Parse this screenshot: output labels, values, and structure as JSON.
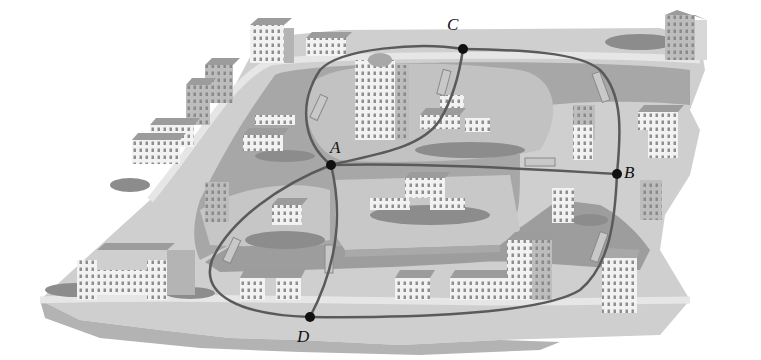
{
  "figure": {
    "palette": {
      "background": "#ffffff",
      "land": "#c9c9c9",
      "land_light": "#dcdcdc",
      "river": "#a8a8a8",
      "river_dark": "#979797",
      "island": "#bdbdbd",
      "road": "#e2e2e2",
      "track": "#5a5a5a",
      "building_face": "#f2f2f2",
      "building_side": "#b4b4b4",
      "building_roof": "#9c9c9c",
      "trees": "#8a8a8a",
      "node": "#111111"
    }
  },
  "nodes": [
    {
      "id": "A",
      "label": "A",
      "x": 331,
      "y": 165,
      "label_x": 331,
      "label_y": 142
    },
    {
      "id": "B",
      "label": "B",
      "x": 617,
      "y": 174,
      "label_x": 623,
      "label_y": 166
    },
    {
      "id": "C",
      "label": "C",
      "x": 463,
      "y": 49,
      "label_x": 447,
      "label_y": 18
    },
    {
      "id": "D",
      "label": "D",
      "x": 310,
      "y": 317,
      "label_x": 296,
      "label_y": 330
    }
  ],
  "edges": [
    {
      "from": "A",
      "to": "C",
      "route": "upper-left loop around tower"
    },
    {
      "from": "A",
      "to": "C",
      "route": "inner curve"
    },
    {
      "from": "C",
      "to": "B",
      "route": "upper-right loop"
    },
    {
      "from": "A",
      "to": "B",
      "route": "middle straight"
    },
    {
      "from": "A",
      "to": "D",
      "route": "left outer loop"
    },
    {
      "from": "A",
      "to": "D",
      "route": "inner straight"
    },
    {
      "from": "D",
      "to": "B",
      "route": "bottom loop"
    }
  ]
}
